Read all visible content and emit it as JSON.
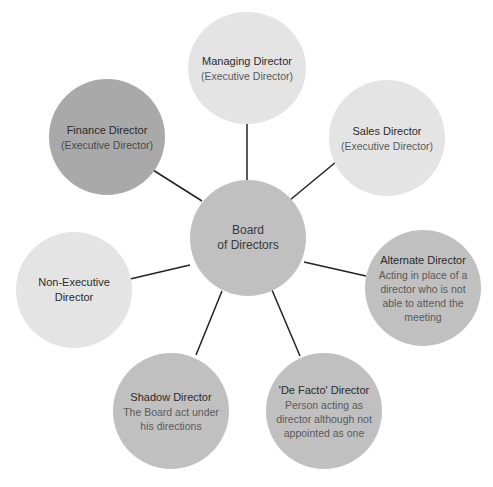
{
  "diagram": {
    "type": "hub-and-spoke",
    "colors": {
      "light": "#e4e4e4",
      "mid": "#c0c0c0",
      "dark": "#a9a9a9",
      "connector": "#222222"
    },
    "center": {
      "title": "Board of Directors",
      "title_line1": "Board",
      "title_line2": "of Directors"
    },
    "nodes": [
      {
        "title": "Managing Director",
        "sub": "(Executive Director)"
      },
      {
        "title": "Sales Director",
        "sub": "(Executive Director)"
      },
      {
        "title": "Alternate Director",
        "sub": "Acting in place of a director who is not able to attend the meeting"
      },
      {
        "title": "'De Facto' Director",
        "sub": "Person acting as director although not appointed as one"
      },
      {
        "title": "Shadow Director",
        "sub": "The Board act under his directions"
      },
      {
        "title": "Non-Executive Director",
        "sub": ""
      },
      {
        "title": "Finance Director",
        "sub": "(Executive Director)"
      }
    ]
  }
}
